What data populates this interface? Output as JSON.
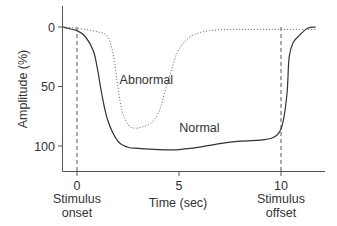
{
  "chart_data": {
    "type": "line",
    "title": "",
    "xlabel": "Time (sec)",
    "ylabel": "Amplitude (%)",
    "xlim": [
      -1.5,
      12.2
    ],
    "ylim": [
      0,
      115
    ],
    "y_inverted": true,
    "grid": false,
    "x_ticks": [
      {
        "value": 0,
        "label": "0",
        "sublabel": [
          "Stimulus",
          "onset"
        ]
      },
      {
        "value": 5,
        "label": "5",
        "sublabel": []
      },
      {
        "value": 10,
        "label": "10",
        "sublabel": [
          "Stimulus",
          "offset"
        ]
      }
    ],
    "y_ticks": [
      {
        "value": 0,
        "label": "0"
      },
      {
        "value": 50,
        "label": "50"
      },
      {
        "value": 100,
        "label": "100"
      }
    ],
    "vertical_markers": [
      {
        "x": 0,
        "style": "dashed",
        "label": "Stimulus onset"
      },
      {
        "x": 10,
        "style": "dashed",
        "label": "Stimulus offset"
      }
    ],
    "series": [
      {
        "name": "Normal",
        "style": "solid",
        "x": [
          -1.5,
          -0.5,
          0,
          0.4,
          0.8,
          1.0,
          1.2,
          1.5,
          2.0,
          2.5,
          3.0,
          4.0,
          5.0,
          6.0,
          7.0,
          8.0,
          9.0,
          9.6,
          9.9,
          10.1,
          10.3,
          10.4,
          10.6,
          10.9,
          11.3,
          11.7
        ],
        "y": [
          0,
          1,
          3,
          8,
          20,
          35,
          55,
          78,
          96,
          101,
          102,
          103,
          103,
          101,
          98,
          96,
          95,
          93,
          89,
          80,
          55,
          25,
          13,
          7,
          1,
          0
        ]
      },
      {
        "name": "Abnormal",
        "style": "dotted",
        "x": [
          -1.5,
          0,
          1.0,
          1.5,
          1.8,
          2.0,
          2.2,
          2.5,
          2.8,
          3.2,
          3.6,
          4.0,
          4.3,
          4.6,
          4.9,
          5.3,
          5.8,
          6.5,
          7.5,
          8.5,
          10.0,
          11.7
        ],
        "y": [
          0,
          1,
          4,
          8,
          25,
          50,
          70,
          82,
          85,
          84,
          81,
          72,
          55,
          38,
          22,
          12,
          6,
          3,
          2,
          2,
          2,
          2
        ]
      }
    ],
    "annotations": [
      {
        "text": "Abnormal",
        "x": 3.4,
        "y": 48
      },
      {
        "text": "Normal",
        "x": 6.0,
        "y": 88
      }
    ]
  }
}
